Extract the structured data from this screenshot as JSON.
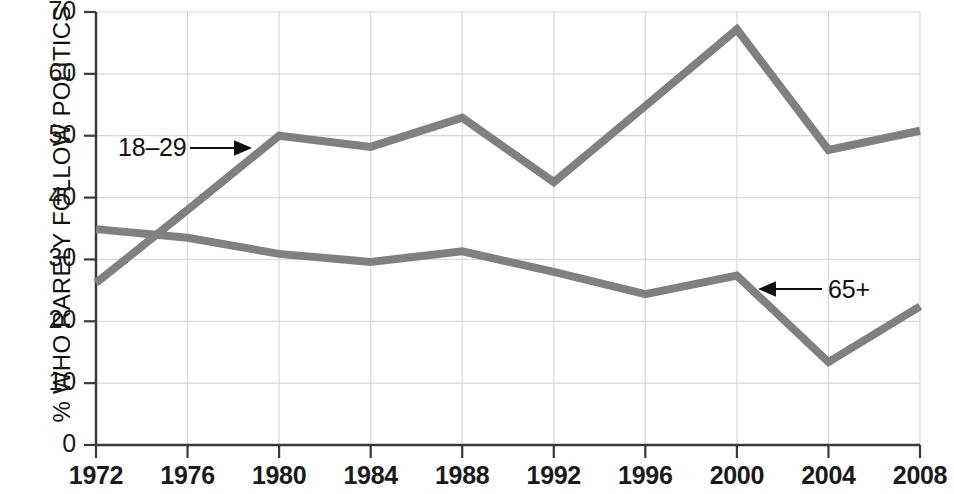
{
  "chart_data": {
    "type": "line",
    "title": "",
    "xlabel": "",
    "ylabel": "% WHO RARELY FOLLOW POLITICS",
    "x": [
      1972,
      1976,
      1980,
      1984,
      1988,
      1992,
      1996,
      2000,
      2004,
      2008
    ],
    "categories": [
      "1972",
      "1976",
      "1980",
      "1984",
      "1988",
      "1992",
      "1996",
      "2000",
      "2004",
      "2008"
    ],
    "xlim": [
      1972,
      2008
    ],
    "ylim": [
      0,
      70
    ],
    "yticks": [
      0,
      10,
      20,
      30,
      40,
      50,
      60,
      70
    ],
    "ytick_labels": [
      "0",
      "10",
      "20",
      "30",
      "40",
      "50",
      "60",
      "70"
    ],
    "grid": true,
    "legend_position": "inline-annotations",
    "series": [
      {
        "name": "18-29",
        "label": "18–29",
        "color": "#808080",
        "values": [
          26.2,
          38.0,
          50.0,
          48.2,
          52.9,
          42.5,
          54.8,
          67.2,
          47.7,
          50.8
        ]
      },
      {
        "name": "65+",
        "label": "65+",
        "color": "#808080",
        "values": [
          34.9,
          33.5,
          30.9,
          29.6,
          31.3,
          28.0,
          24.4,
          27.4,
          13.4,
          22.4
        ]
      }
    ],
    "annotations": [
      {
        "text": "18–29",
        "series": "18-29",
        "arrow_direction": "right",
        "label_x": 120,
        "label_y": 135,
        "arrow_from_x": 190,
        "arrow_to_x": 250,
        "arrow_y": 148
      },
      {
        "text": "65+",
        "series": "65+",
        "arrow_direction": "left",
        "label_x": 830,
        "label_y": 277,
        "arrow_from_x": 822,
        "arrow_to_x": 760,
        "arrow_y": 289
      }
    ],
    "colors": {
      "line": "#808080",
      "axis": "#3a3a3a",
      "grid": "#d8d8d8",
      "text": "#1a1a1a",
      "background": "#ffffff"
    }
  },
  "axes": {
    "y_title": "% WHO RARELY FOLLOW POLITICS",
    "y_ticks": [
      {
        "label": "70",
        "value": 70
      },
      {
        "label": "60",
        "value": 60
      },
      {
        "label": "50",
        "value": 50
      },
      {
        "label": "40",
        "value": 40
      },
      {
        "label": "30",
        "value": 30
      },
      {
        "label": "20",
        "value": 20
      },
      {
        "label": "10",
        "value": 10
      },
      {
        "label": "0",
        "value": 0
      }
    ],
    "x_ticks": [
      {
        "label": "1972",
        "value": 1972
      },
      {
        "label": "1976",
        "value": 1976
      },
      {
        "label": "1980",
        "value": 1980
      },
      {
        "label": "1984",
        "value": 1984
      },
      {
        "label": "1988",
        "value": 1988
      },
      {
        "label": "1992",
        "value": 1992
      },
      {
        "label": "1996",
        "value": 1996
      },
      {
        "label": "2000",
        "value": 2000
      },
      {
        "label": "2004",
        "value": 2004
      },
      {
        "label": "2008",
        "value": 2008
      }
    ]
  },
  "annotations": {
    "young_label": "18–29",
    "old_label": "65+"
  }
}
